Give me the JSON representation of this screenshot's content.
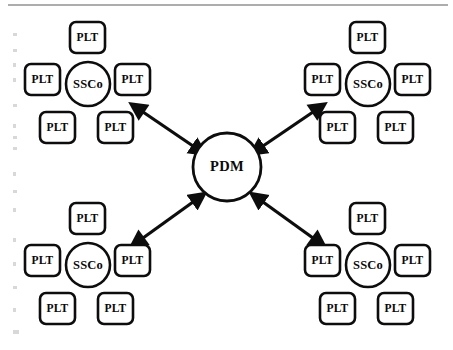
{
  "diagram": {
    "type": "hub-and-spoke",
    "colors": {
      "stroke": "#0d0d0d",
      "fill": "#ffffff",
      "background": "#ffffff",
      "rule": "#5c5c5c",
      "speck": "#d8d8d8"
    },
    "hub": {
      "label": "PDM",
      "shape": "circle",
      "cx": 227,
      "cy": 167,
      "r": 34
    },
    "clusters": [
      {
        "id": "cluster-top-left",
        "position": "top-left",
        "hub": {
          "label": "SSCo",
          "cx": 88,
          "cy": 84,
          "r": 22
        },
        "nodes": [
          {
            "label": "PLT",
            "slot": "top",
            "x": 70,
            "y": 22,
            "w": 35,
            "h": 31
          },
          {
            "label": "PLT",
            "slot": "left",
            "x": 25,
            "y": 64,
            "w": 35,
            "h": 31
          },
          {
            "label": "PLT",
            "slot": "right",
            "x": 115,
            "y": 64,
            "w": 35,
            "h": 31
          },
          {
            "label": "PLT",
            "slot": "bottom-left",
            "x": 40,
            "y": 112,
            "w": 35,
            "h": 31
          },
          {
            "label": "PLT",
            "slot": "bottom-right",
            "x": 98,
            "y": 112,
            "w": 35,
            "h": 31
          }
        ]
      },
      {
        "id": "cluster-top-right",
        "position": "top-right",
        "hub": {
          "label": "SSCo",
          "cx": 368,
          "cy": 84,
          "r": 22
        },
        "nodes": [
          {
            "label": "PLT",
            "slot": "top",
            "x": 350,
            "y": 22,
            "w": 35,
            "h": 31
          },
          {
            "label": "PLT",
            "slot": "left",
            "x": 305,
            "y": 64,
            "w": 35,
            "h": 31
          },
          {
            "label": "PLT",
            "slot": "right",
            "x": 395,
            "y": 64,
            "w": 35,
            "h": 31
          },
          {
            "label": "PLT",
            "slot": "bottom-left",
            "x": 320,
            "y": 112,
            "w": 35,
            "h": 31
          },
          {
            "label": "PLT",
            "slot": "bottom-right",
            "x": 378,
            "y": 112,
            "w": 35,
            "h": 31
          }
        ]
      },
      {
        "id": "cluster-bottom-left",
        "position": "bottom-left",
        "hub": {
          "label": "SSCo",
          "cx": 88,
          "cy": 265,
          "r": 22
        },
        "nodes": [
          {
            "label": "PLT",
            "slot": "top",
            "x": 70,
            "y": 203,
            "w": 35,
            "h": 31
          },
          {
            "label": "PLT",
            "slot": "left",
            "x": 25,
            "y": 245,
            "w": 35,
            "h": 31
          },
          {
            "label": "PLT",
            "slot": "right",
            "x": 115,
            "y": 245,
            "w": 35,
            "h": 31
          },
          {
            "label": "PLT",
            "slot": "bottom-left",
            "x": 40,
            "y": 293,
            "w": 35,
            "h": 31
          },
          {
            "label": "PLT",
            "slot": "bottom-right",
            "x": 98,
            "y": 293,
            "w": 35,
            "h": 31
          }
        ]
      },
      {
        "id": "cluster-bottom-right",
        "position": "bottom-right",
        "hub": {
          "label": "SSCo",
          "cx": 368,
          "cy": 265,
          "r": 22
        },
        "nodes": [
          {
            "label": "PLT",
            "slot": "top",
            "x": 350,
            "y": 203,
            "w": 35,
            "h": 31
          },
          {
            "label": "PLT",
            "slot": "left",
            "x": 305,
            "y": 245,
            "w": 35,
            "h": 31
          },
          {
            "label": "PLT",
            "slot": "right",
            "x": 395,
            "y": 245,
            "w": 35,
            "h": 31
          },
          {
            "label": "PLT",
            "slot": "bottom-left",
            "x": 320,
            "y": 293,
            "w": 35,
            "h": 31
          },
          {
            "label": "PLT",
            "slot": "bottom-right",
            "x": 378,
            "y": 293,
            "w": 35,
            "h": 31
          }
        ]
      }
    ],
    "connectors": [
      {
        "id": "connector-pdm-top-left",
        "from": "PDM",
        "to": "SSCo top-left",
        "arrows": "double",
        "x1": 143,
        "y1": 112,
        "x2": 193,
        "y2": 146
      },
      {
        "id": "connector-pdm-top-right",
        "from": "PDM",
        "to": "SSCo top-right",
        "arrows": "double",
        "x1": 313,
        "y1": 112,
        "x2": 263,
        "y2": 146
      },
      {
        "id": "connector-pdm-bottom-left",
        "from": "PDM",
        "to": "SSCo bottom-left",
        "arrows": "double",
        "x1": 143,
        "y1": 238,
        "x2": 193,
        "y2": 202
      },
      {
        "id": "connector-pdm-bottom-right",
        "from": "PDM",
        "to": "SSCo bottom-right",
        "arrows": "double",
        "x1": 313,
        "y1": 238,
        "x2": 263,
        "y2": 202
      }
    ],
    "top_rule": {
      "x1": 8,
      "y1": 5,
      "x2": 448,
      "y2": 5
    }
  }
}
